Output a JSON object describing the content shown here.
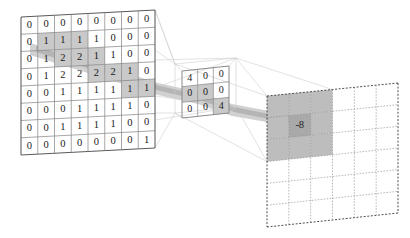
{
  "diagram": {
    "colors": {
      "grid_line": "#8a8a8a",
      "grid_line_dark": "#5a5a5a",
      "highlight_band": "#c9c9c9",
      "highlight_cell": "#bdbdbd",
      "connector": "#cfcfcf",
      "text": "#1a1a1a",
      "background": "#ffffff",
      "output_border": "#3a3a3a"
    }
  },
  "input_layer": {
    "name": "input-feature-map",
    "rows": 8,
    "cols": 8,
    "values": [
      [
        0,
        0,
        0,
        0,
        0,
        0,
        0,
        0
      ],
      [
        0,
        1,
        1,
        1,
        1,
        0,
        0,
        0
      ],
      [
        0,
        1,
        2,
        2,
        1,
        1,
        0,
        0
      ],
      [
        0,
        1,
        2,
        2,
        2,
        2,
        1,
        0
      ],
      [
        0,
        0,
        1,
        1,
        1,
        1,
        1,
        1
      ],
      [
        0,
        0,
        0,
        1,
        1,
        1,
        1,
        0
      ],
      [
        0,
        0,
        1,
        1,
        1,
        1,
        0,
        0
      ],
      [
        0,
        0,
        0,
        0,
        0,
        0,
        0,
        1
      ]
    ],
    "highlighted_cells": [
      [
        1,
        1
      ],
      [
        1,
        2
      ],
      [
        1,
        3
      ],
      [
        2,
        2
      ],
      [
        2,
        3
      ],
      [
        2,
        4
      ],
      [
        3,
        4
      ],
      [
        3,
        5
      ],
      [
        3,
        6
      ],
      [
        4,
        6
      ],
      [
        4,
        7
      ]
    ]
  },
  "kernel_layer": {
    "name": "convolution-kernel",
    "rows": 3,
    "cols": 3,
    "values": [
      [
        4,
        0,
        0
      ],
      [
        0,
        0,
        0
      ],
      [
        0,
        0,
        4
      ]
    ],
    "highlighted_cells": [
      [
        1,
        0
      ],
      [
        1,
        1
      ],
      [
        2,
        2
      ]
    ]
  },
  "output_layer": {
    "name": "output-feature-map",
    "rows": 6,
    "cols": 6,
    "values": [
      [
        "",
        "",
        "",
        "",
        "",
        ""
      ],
      [
        "",
        "-8",
        "",
        "",
        "",
        ""
      ],
      [
        "",
        "",
        "",
        "",
        "",
        ""
      ],
      [
        "",
        "",
        "",
        "",
        "",
        ""
      ],
      [
        "",
        "",
        "",
        "",
        "",
        ""
      ],
      [
        "",
        "",
        "",
        "",
        "",
        ""
      ]
    ],
    "result_value": "-8",
    "result_row": 1,
    "result_col": 1,
    "highlighted_cells": [
      [
        0,
        0
      ],
      [
        0,
        1
      ],
      [
        0,
        2
      ],
      [
        1,
        0
      ],
      [
        1,
        1
      ],
      [
        1,
        2
      ],
      [
        2,
        0
      ],
      [
        2,
        1
      ],
      [
        2,
        2
      ]
    ]
  }
}
